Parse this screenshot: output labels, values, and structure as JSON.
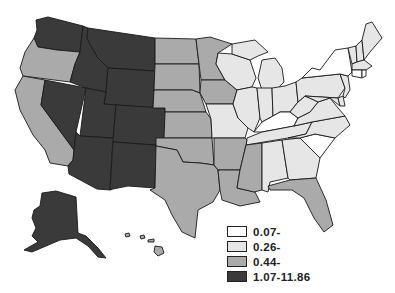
{
  "map": {
    "type": "choropleth",
    "region": "United States",
    "colors": {
      "c1": "#ffffff",
      "c2": "#e6e6e6",
      "c3": "#aaaaaa",
      "c4": "#3a3a3a"
    },
    "classes": {
      "WA": "c4",
      "ID": "c4",
      "MT": "c4",
      "WY": "c4",
      "NV": "c4",
      "UT": "c4",
      "CO": "c4",
      "AZ": "c4",
      "NM": "c4",
      "AK": "c4",
      "OR": "c3",
      "CA": "c3",
      "ND": "c3",
      "SD": "c3",
      "NE": "c3",
      "KS": "c3",
      "MN": "c3",
      "IA": "c3",
      "OK": "c3",
      "TX": "c3",
      "AR": "c3",
      "LA": "c3",
      "MS": "c3",
      "FL": "c3",
      "HI": "c3",
      "WI": "c2",
      "MI": "c2",
      "IL": "c2",
      "IN": "c2",
      "OH": "c2",
      "MO": "c2",
      "TN": "c2",
      "AL": "c2",
      "GA": "c2",
      "VA": "c2",
      "WV": "c2",
      "PA": "c2",
      "NC": "c2",
      "MD": "c2",
      "DE": "c2",
      "NJ": "c2",
      "ME": "c2",
      "NH": "c2",
      "VT": "c2",
      "MA": "c2",
      "KY": "c1",
      "SC": "c1",
      "NY": "c1",
      "CT": "c1",
      "RI": "c1"
    }
  },
  "legend": {
    "items": [
      {
        "label": "0.07-",
        "class": "c1"
      },
      {
        "label": "0.26-",
        "class": "c2"
      },
      {
        "label": "0.44-",
        "class": "c3"
      },
      {
        "label": "1.07-11.86",
        "class": "c4"
      }
    ]
  }
}
